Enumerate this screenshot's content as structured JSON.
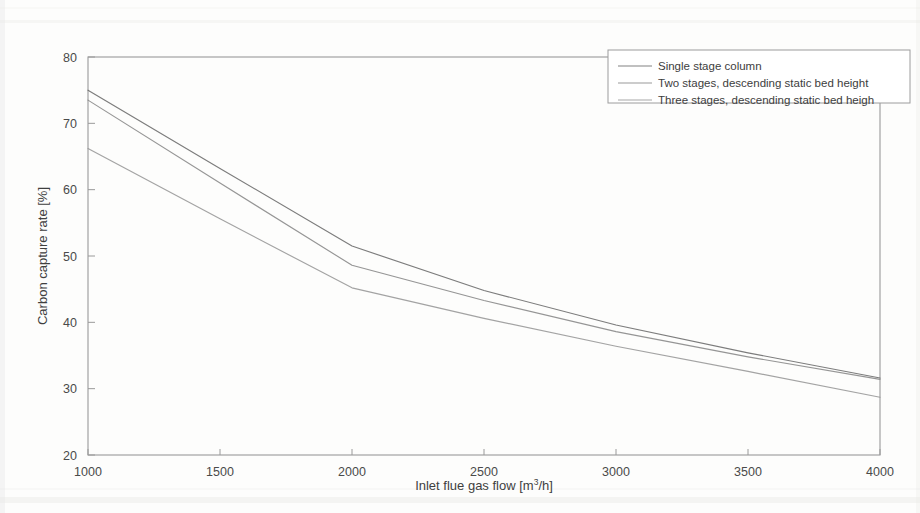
{
  "chart_data": {
    "type": "line",
    "title": "",
    "xlabel": "Inlet flue gas flow [m3/h]",
    "xlabel_base": "Inlet flue gas flow [m",
    "xlabel_sup": "3",
    "xlabel_tail": "/h]",
    "ylabel": "Carbon capture rate [%]",
    "xlim": [
      1000,
      4000
    ],
    "ylim": [
      20,
      80
    ],
    "xticks": [
      1000,
      1500,
      2000,
      2500,
      3000,
      3500,
      4000
    ],
    "xtick_labels": [
      "1000",
      "1500",
      "2000",
      "2500",
      "3000",
      "3500",
      "4000"
    ],
    "yticks": [
      20,
      30,
      40,
      50,
      60,
      70,
      80
    ],
    "ytick_labels": [
      "20",
      "30",
      "40",
      "50",
      "60",
      "70",
      "80"
    ],
    "grid": false,
    "legend_position": "top-right",
    "x": [
      1000,
      1500,
      2000,
      2500,
      3000,
      3500,
      4000
    ],
    "series": [
      {
        "name": "Single stage column",
        "color": "#6e6e6e",
        "values": [
          75.0,
          63.2,
          51.5,
          44.8,
          39.6,
          35.4,
          31.6
        ]
      },
      {
        "name": "Two stages, descending static bed height",
        "color": "#8a8a8a",
        "values": [
          73.5,
          61.0,
          48.6,
          43.3,
          38.6,
          34.8,
          31.4
        ]
      },
      {
        "name": "Three stages, descending static bed heigh",
        "color": "#999999",
        "values": [
          66.2,
          55.6,
          45.2,
          40.6,
          36.4,
          32.6,
          28.7
        ]
      }
    ]
  },
  "axes": {
    "frame_color": "#9a9a9a"
  },
  "legend": {
    "entries": [
      "Single stage column",
      "Two stages, descending static bed height",
      "Three stages, descending static bed heigh"
    ]
  }
}
